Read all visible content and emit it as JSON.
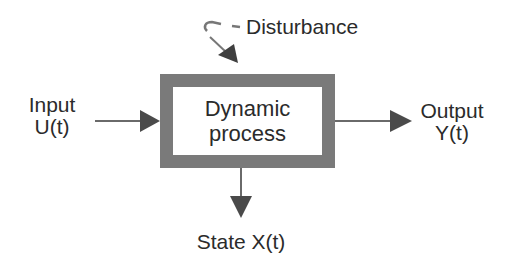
{
  "diagram": {
    "block": {
      "line1": "Dynamic",
      "line2": "process",
      "border_color": "#7a7a7a"
    },
    "input": {
      "line1": "Input",
      "line2": "U(t)"
    },
    "output": {
      "line1": "Output",
      "line2": "Y(t)"
    },
    "disturbance": {
      "label": "Disturbance"
    },
    "state": {
      "label": "State X(t)"
    },
    "colors": {
      "arrow": "#4a4a4a",
      "text": "#2b2b2b",
      "background": "#ffffff"
    }
  }
}
